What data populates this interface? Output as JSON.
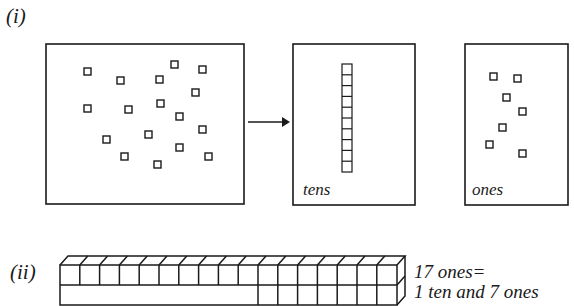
{
  "part_i": {
    "label": "(i)",
    "scatter_box": {
      "count": 17
    },
    "arrow": "right-arrow",
    "tens_box": {
      "label": "tens",
      "rod_cells": 10
    },
    "ones_box": {
      "label": "ones",
      "count": 7
    }
  },
  "part_ii": {
    "label": "(ii)",
    "bar": {
      "total_cubes": 17,
      "tens_rod_cubes": 10,
      "single_cubes": 7
    },
    "equation_line1": "17 ones=",
    "equation_line2": "1 ten and 7 ones"
  },
  "colors": {
    "ink": "#1a1a1a",
    "background": "#ffffff"
  }
}
